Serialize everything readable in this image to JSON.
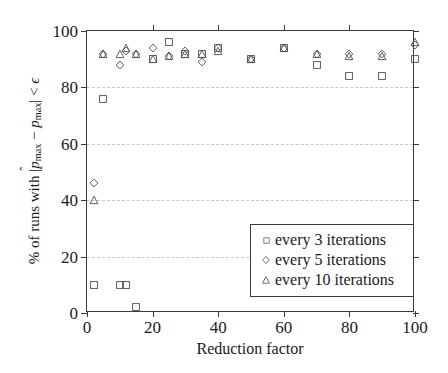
{
  "chart_data": {
    "type": "scatter",
    "title": "",
    "xlabel": "Reduction factor",
    "ylabel_text": "% of runs with |p̂max − pmax| < ε",
    "xlim": [
      0,
      100
    ],
    "ylim": [
      0,
      100
    ],
    "xticks": [
      0,
      20,
      40,
      60,
      80,
      100
    ],
    "yticks": [
      0,
      20,
      40,
      60,
      80,
      100
    ],
    "grid": "horizontal-dashed",
    "legend_position": "bottom-right",
    "x": [
      2,
      5,
      10,
      12,
      15,
      20,
      25,
      30,
      35,
      40,
      50,
      60,
      70,
      80,
      90,
      100
    ],
    "series": [
      {
        "name": "every 3 iterations",
        "marker": "square",
        "values": [
          10,
          76,
          10,
          10,
          2,
          90,
          96,
          92,
          92,
          94,
          90,
          94,
          88,
          84,
          84,
          90
        ]
      },
      {
        "name": "every 5 iterations",
        "marker": "diamond",
        "values": [
          46,
          92,
          88,
          93,
          92,
          94,
          91,
          93,
          89,
          94,
          90,
          94,
          92,
          92,
          92,
          95
        ]
      },
      {
        "name": "every 10 iterations",
        "marker": "triangle",
        "values": [
          40,
          92,
          92,
          94,
          92,
          90,
          91,
          92,
          92,
          93,
          90,
          94,
          92,
          91,
          91,
          96
        ]
      }
    ],
    "colors": {
      "axis": "#3a3a3a",
      "grid": "#c9c9c9",
      "marker_stroke": "#555555",
      "background": "#ffffff"
    }
  },
  "axis": {
    "x_tick_labels": [
      "0",
      "20",
      "40",
      "60",
      "80",
      "100"
    ],
    "y_tick_labels": [
      "0",
      "20",
      "40",
      "60",
      "80",
      "100"
    ],
    "x_title": "Reduction factor"
  },
  "ylabel_parts": {
    "prefix": "% of runs with ",
    "open": "|",
    "p_hat": "p",
    "hat": "̂",
    "sub1": "max",
    "minus": " − ",
    "p": "p",
    "sub2": "max",
    "close": "|",
    "lt": " < ",
    "epsilon": "ϵ"
  },
  "legend": {
    "items": [
      {
        "label": "every 3 iterations",
        "marker": "square-marker"
      },
      {
        "label": "every 5 iterations",
        "marker": "diamond-marker"
      },
      {
        "label": "every 10 iterations",
        "marker": "triangle-marker"
      }
    ]
  }
}
